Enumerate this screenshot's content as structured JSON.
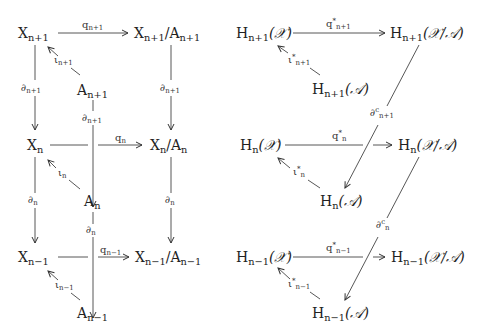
{
  "left_diagram": {
    "nodes": {
      "X_np1": {
        "base": "X",
        "sub": "n+1"
      },
      "Q_np1": {
        "base": "X",
        "sub": "n+1",
        "mid": "/A",
        "sub2": "n+1"
      },
      "A_np1": {
        "base": "A",
        "sub": "n+1"
      },
      "X_n": {
        "base": "X",
        "sub": "n"
      },
      "Q_n": {
        "base": "X",
        "sub": "n",
        "mid": "/A",
        "sub2": "n"
      },
      "A_n": {
        "base": "A",
        "sub": "n"
      },
      "X_nm1": {
        "base": "X",
        "sub": "n−1"
      },
      "Q_nm1": {
        "base": "X",
        "sub": "n−1",
        "mid": "/A",
        "sub2": "n−1"
      },
      "A_nm1": {
        "base": "A",
        "sub": "n−1"
      }
    },
    "labels": {
      "q_np1": {
        "base": "q",
        "sub": "n+1"
      },
      "q_n": {
        "base": "q",
        "sub": "n"
      },
      "q_nm1": {
        "base": "q",
        "sub": "n−1"
      },
      "iota_np1": {
        "base": "ι",
        "sub": "n+1"
      },
      "iota_n": {
        "base": "ι",
        "sub": "n"
      },
      "iota_nm1": {
        "base": "ι",
        "sub": "n−1"
      },
      "d_np1_left": {
        "base": "∂",
        "sub": "n+1"
      },
      "d_np1_mid": {
        "base": "∂",
        "sub": "n+1"
      },
      "d_np1_right": {
        "base": "∂",
        "sub": "n+1"
      },
      "d_n_left": {
        "base": "∂",
        "sub": "n"
      },
      "d_n_mid": {
        "base": "∂",
        "sub": "n"
      },
      "d_n_right": {
        "base": "∂",
        "sub": "n"
      }
    }
  },
  "right_diagram": {
    "nodes": {
      "HX_np1": {
        "base": "H",
        "sub": "n+1",
        "arg": "(𝒳)"
      },
      "HQ_np1": {
        "base": "H",
        "sub": "n+1",
        "arg": "(𝒳/𝒜)"
      },
      "HA_np1": {
        "base": "H",
        "sub": "n+1",
        "arg": "(𝒜)"
      },
      "HX_n": {
        "base": "H",
        "sub": "n",
        "arg": "(𝒳)"
      },
      "HQ_n": {
        "base": "H",
        "sub": "n",
        "arg": "(𝒳/𝒜)"
      },
      "HA_n": {
        "base": "H",
        "sub": "n",
        "arg": "(𝒜)"
      },
      "HX_nm1": {
        "base": "H",
        "sub": "n−1",
        "arg": "(𝒳)"
      },
      "HQ_nm1": {
        "base": "H",
        "sub": "n−1",
        "arg": "(𝒳/𝒜)"
      },
      "HA_nm1": {
        "base": "H",
        "sub": "n−1",
        "arg": "(𝒜)"
      }
    },
    "labels": {
      "qs_np1": {
        "base": "q",
        "sup": "*",
        "sub": "n+1"
      },
      "qs_n": {
        "base": "q",
        "sup": "*",
        "sub": "n"
      },
      "qs_nm1": {
        "base": "q",
        "sup": "*",
        "sub": "n−1"
      },
      "is_np1": {
        "base": "ι",
        "sup": "*",
        "sub": "n+1"
      },
      "is_n": {
        "base": "ι",
        "sup": "*",
        "sub": "n"
      },
      "is_nm1": {
        "base": "ι",
        "sup": "*",
        "sub": "n−1"
      },
      "dc_np1": {
        "base": "∂",
        "sup": "c",
        "sub": "n+1"
      },
      "dc_n": {
        "base": "∂",
        "sup": "c",
        "sub": "n"
      }
    }
  }
}
